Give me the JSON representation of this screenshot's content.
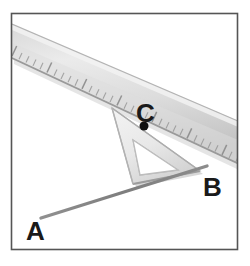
{
  "figure": {
    "type": "geometry-construction-photo",
    "frame": {
      "border_color": "#555555",
      "background_color": "#ffffff",
      "x": 11,
      "y": 13,
      "width": 227,
      "height": 237
    },
    "labels": [
      {
        "id": "A",
        "text": "A",
        "x": 26,
        "y": 240,
        "font_size": 26
      },
      {
        "id": "B",
        "text": "B",
        "x": 203,
        "y": 196,
        "font_size": 26
      },
      {
        "id": "C",
        "text": "C",
        "x": 136,
        "y": 122,
        "font_size": 26
      }
    ],
    "point_marker": {
      "name": "point-c-dot",
      "x": 144,
      "y": 126,
      "radius": 4.5,
      "color": "#101010"
    },
    "line_ab": {
      "name": "line-segment-ab",
      "x1": 41,
      "y1": 218,
      "x2": 207,
      "y2": 166,
      "width": 3.4,
      "color": "#8a8a8a"
    },
    "ruler": {
      "name": "ruler",
      "body_color_light": "#e6e6e6",
      "body_color_dark": "#b8b8b8",
      "edge_color": "#9a9a9a",
      "tick_color": "#8e8e8e",
      "top_edge": {
        "x1": 12,
        "y1": 26,
        "x2": 250,
        "y2": 128
      },
      "bottom_edge": {
        "x1": 12,
        "y1": 56,
        "x2": 250,
        "y2": 168
      },
      "tick_count": 34,
      "tick_long_px": 11,
      "tick_short_px": 7
    },
    "set_square": {
      "name": "set-square",
      "fill_color": "#ececec",
      "edge_color": "#b0b0b0",
      "shadow_color": "#9b9b9b",
      "outer_vertices": [
        {
          "x": 112,
          "y": 108
        },
        {
          "x": 200,
          "y": 171
        },
        {
          "x": 133,
          "y": 184
        }
      ],
      "inner_vertices": [
        {
          "x": 133,
          "y": 140
        },
        {
          "x": 178,
          "y": 170
        },
        {
          "x": 140,
          "y": 175
        }
      ]
    }
  }
}
